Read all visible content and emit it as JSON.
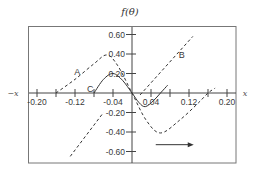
{
  "chart_data": {
    "type": "line",
    "title": "f(θ)",
    "xlabel": "x",
    "xlabel_negative": "−x",
    "ylabel": "f(θ)",
    "xlim": [
      -0.22,
      0.22
    ],
    "ylim": [
      -0.7,
      0.72
    ],
    "grid": false,
    "x_ticks": [
      -0.2,
      -0.16,
      -0.12,
      -0.08,
      -0.04,
      0.04,
      0.08,
      0.12,
      0.16,
      0.2
    ],
    "x_tick_labels": [
      "-0.20",
      "-0.12",
      "-0.04",
      "0.04",
      "0.12",
      "0.20"
    ],
    "x_tick_label_values": [
      -0.2,
      -0.12,
      -0.04,
      0.04,
      0.12,
      0.2
    ],
    "y_ticks": [
      0.6,
      0.4,
      0.2,
      -0.2,
      -0.4,
      -0.6
    ],
    "y_tick_labels": [
      "0.60",
      "0.40",
      "0.20",
      "-0.20",
      "-0.40",
      "-0.60"
    ],
    "series": [
      {
        "name": "A",
        "style": "dashed",
        "x": [
          -0.16,
          -0.12,
          -0.08,
          -0.053,
          -0.03,
          0.0,
          0.03,
          0.06,
          0.1,
          0.14,
          0.16,
          0.175
        ],
        "y": [
          0.0,
          0.14,
          0.3,
          0.39,
          0.28,
          0.0,
          -0.28,
          -0.41,
          -0.28,
          -0.1,
          0.0,
          0.05
        ]
      },
      {
        "name": "C",
        "style": "solid",
        "x": [
          -0.08,
          -0.06,
          -0.04,
          -0.02,
          0.0,
          0.015,
          0.028,
          0.045,
          0.06,
          0.075
        ],
        "y": [
          0.0,
          0.14,
          0.2,
          0.13,
          0.0,
          -0.1,
          -0.14,
          -0.08,
          0.0,
          0.08
        ]
      },
      {
        "name": "B",
        "style": "dashed",
        "x": [
          0.017,
          0.128
        ],
        "y": [
          -0.02,
          0.58
        ]
      },
      {
        "name": "B (lower continuation)",
        "style": "dashed",
        "x": [
          -0.13,
          -0.06
        ],
        "y": [
          -0.65,
          -0.2
        ]
      }
    ],
    "annotations": [
      {
        "text": "A",
        "x": -0.115,
        "y": 0.22
      },
      {
        "text": "B",
        "x": 0.105,
        "y": 0.39
      },
      {
        "text": "C",
        "x": -0.088,
        "y": 0.045
      },
      {
        "text": "→ (direction arrow)",
        "x": 0.05,
        "x_end": 0.13,
        "y": -0.53
      }
    ]
  },
  "labels": {
    "title": "f(θ)",
    "x_pos": "x",
    "x_neg": "−x",
    "curve_a": "A",
    "curve_b": "B",
    "curve_c": "C"
  }
}
